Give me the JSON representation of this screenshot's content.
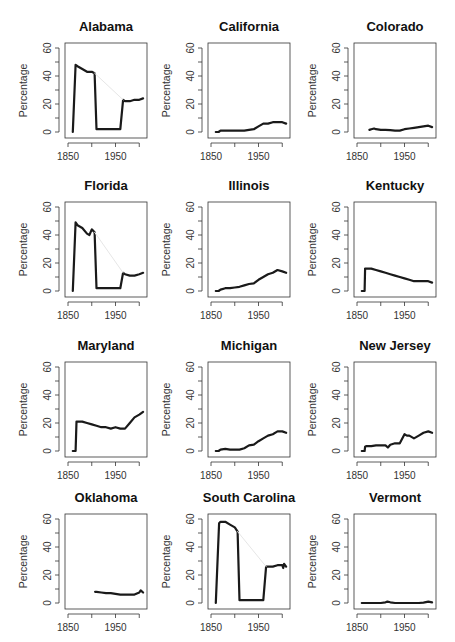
{
  "figure": {
    "ylabel": "Percentage",
    "x_ticks": [
      1850,
      1900,
      1950,
      2000
    ],
    "x_tick_labels": [
      "1850",
      "1950"
    ],
    "y_ticks": [
      0,
      10,
      20,
      30,
      40,
      50,
      60
    ],
    "y_tick_labels": [
      "0",
      "20",
      "40",
      "60"
    ],
    "line_color": "#1a1a1a",
    "gap_color": "#e6e6e6"
  },
  "chart_data": [
    {
      "type": "line",
      "title": "Alabama",
      "xlabel": "",
      "ylabel": "Percentage",
      "xlim": [
        1850,
        2010
      ],
      "ylim": [
        0,
        60
      ],
      "grid": false,
      "series": [
        {
          "name": "main",
          "x": [
            1860,
            1866,
            1870,
            1880,
            1890,
            1900,
            1906,
            1910,
            1920,
            1930,
            1940,
            1950,
            1960,
            1966,
            1970,
            1980,
            1990,
            2000,
            2008
          ],
          "y": [
            0,
            48,
            47,
            45,
            43,
            43,
            42,
            2,
            2,
            2,
            2,
            2,
            2,
            23,
            22,
            22,
            23,
            23,
            24
          ]
        },
        {
          "name": "faint",
          "x": [
            1906,
            1966
          ],
          "y": [
            42,
            23
          ]
        }
      ]
    },
    {
      "type": "line",
      "title": "California",
      "xlabel": "",
      "ylabel": "Percentage",
      "xlim": [
        1850,
        2010
      ],
      "ylim": [
        0,
        60
      ],
      "grid": false,
      "series": [
        {
          "name": "main",
          "x": [
            1860,
            1866,
            1870,
            1880,
            1890,
            1900,
            1910,
            1920,
            1930,
            1940,
            1950,
            1960,
            1970,
            1980,
            1990,
            2000,
            2008
          ],
          "y": [
            0,
            0,
            1,
            1,
            1,
            1,
            1,
            1,
            1.5,
            2,
            4,
            6,
            6,
            7,
            7,
            7,
            6
          ]
        }
      ]
    },
    {
      "type": "line",
      "title": "Colorado",
      "xlabel": "",
      "ylabel": "Percentage",
      "xlim": [
        1850,
        2010
      ],
      "ylim": [
        0,
        60
      ],
      "grid": false,
      "series": [
        {
          "name": "main",
          "x": [
            1876,
            1880,
            1886,
            1890,
            1900,
            1910,
            1920,
            1930,
            1940,
            1950,
            1960,
            1970,
            1980,
            1990,
            2000,
            2008
          ],
          "y": [
            1.5,
            2,
            2.5,
            2,
            1.5,
            1.5,
            1.3,
            1,
            1,
            2,
            2.5,
            3,
            3.5,
            4,
            4.5,
            3.5
          ]
        }
      ]
    },
    {
      "type": "line",
      "title": "Florida",
      "xlabel": "",
      "ylabel": "Percentage",
      "xlim": [
        1850,
        2010
      ],
      "ylim": [
        0,
        60
      ],
      "grid": false,
      "series": [
        {
          "name": "main",
          "x": [
            1860,
            1866,
            1870,
            1880,
            1890,
            1895,
            1900,
            1906,
            1910,
            1920,
            1930,
            1940,
            1950,
            1960,
            1966,
            1970,
            1980,
            1990,
            2000,
            2008
          ],
          "y": [
            0,
            49,
            47,
            45,
            41,
            40,
            44,
            42,
            2,
            2,
            2,
            2,
            2,
            2,
            13,
            12,
            11,
            11,
            12,
            13
          ]
        },
        {
          "name": "faint",
          "x": [
            1906,
            1966
          ],
          "y": [
            42,
            13
          ]
        }
      ]
    },
    {
      "type": "line",
      "title": "Illinois",
      "xlabel": "",
      "ylabel": "Percentage",
      "xlim": [
        1850,
        2010
      ],
      "ylim": [
        0,
        60
      ],
      "grid": false,
      "series": [
        {
          "name": "main",
          "x": [
            1860,
            1866,
            1870,
            1880,
            1890,
            1900,
            1910,
            1920,
            1930,
            1940,
            1950,
            1960,
            1970,
            1980,
            1990,
            2000,
            2008
          ],
          "y": [
            0,
            0,
            1,
            2,
            2,
            2.5,
            3,
            4,
            5,
            5.5,
            8,
            10,
            12,
            13,
            15,
            14,
            13
          ]
        }
      ]
    },
    {
      "type": "line",
      "title": "Kentucky",
      "xlabel": "",
      "ylabel": "Percentage",
      "xlim": [
        1850,
        2010
      ],
      "ylim": [
        0,
        60
      ],
      "grid": false,
      "series": [
        {
          "name": "main",
          "x": [
            1860,
            1866,
            1867,
            1870,
            1880,
            1890,
            1900,
            1910,
            1920,
            1930,
            1940,
            1950,
            1960,
            1970,
            1980,
            1990,
            2000,
            2008
          ],
          "y": [
            0,
            0,
            16,
            16,
            16,
            15,
            14,
            13,
            12,
            11,
            10,
            9,
            8,
            7,
            7,
            7,
            7,
            6
          ]
        }
      ]
    },
    {
      "type": "line",
      "title": "Maryland",
      "xlabel": "",
      "ylabel": "Percentage",
      "xlim": [
        1850,
        2010
      ],
      "ylim": [
        0,
        60
      ],
      "grid": false,
      "series": [
        {
          "name": "main",
          "x": [
            1860,
            1866,
            1868,
            1870,
            1880,
            1890,
            1900,
            1910,
            1920,
            1930,
            1940,
            1950,
            1960,
            1970,
            1980,
            1990,
            2000,
            2008
          ],
          "y": [
            0,
            0,
            21,
            21,
            21,
            20,
            19,
            18,
            17,
            17,
            16,
            17,
            16,
            16,
            20,
            24,
            26,
            28
          ]
        }
      ]
    },
    {
      "type": "line",
      "title": "Michigan",
      "xlabel": "",
      "ylabel": "Percentage",
      "xlim": [
        1850,
        2010
      ],
      "ylim": [
        0,
        60
      ],
      "grid": false,
      "series": [
        {
          "name": "main",
          "x": [
            1860,
            1866,
            1870,
            1880,
            1890,
            1900,
            1910,
            1920,
            1930,
            1940,
            1950,
            1960,
            1970,
            1980,
            1990,
            2000,
            2008
          ],
          "y": [
            0,
            0,
            1,
            1.5,
            1,
            1,
            1,
            2,
            4,
            4.5,
            7,
            9,
            11,
            12,
            14,
            14,
            13
          ]
        }
      ]
    },
    {
      "type": "line",
      "title": "New Jersey",
      "xlabel": "",
      "ylabel": "Percentage",
      "xlim": [
        1850,
        2010
      ],
      "ylim": [
        0,
        60
      ],
      "grid": false,
      "series": [
        {
          "name": "main",
          "x": [
            1860,
            1866,
            1867,
            1870,
            1880,
            1890,
            1900,
            1910,
            1915,
            1920,
            1930,
            1940,
            1950,
            1955,
            1960,
            1970,
            1980,
            1990,
            2000,
            2008
          ],
          "y": [
            0,
            0,
            3,
            3.5,
            3.5,
            4,
            4,
            4,
            2.5,
            4.5,
            5.5,
            5.5,
            12,
            11,
            11,
            9,
            11,
            13,
            14,
            13
          ]
        }
      ]
    },
    {
      "type": "line",
      "title": "Oklahoma",
      "xlabel": "",
      "ylabel": "Percentage",
      "xlim": [
        1850,
        2010
      ],
      "ylim": [
        0,
        60
      ],
      "grid": false,
      "series": [
        {
          "name": "main",
          "x": [
            1907,
            1910,
            1920,
            1930,
            1940,
            1950,
            1960,
            1970,
            1980,
            1990,
            2000,
            2003,
            2008
          ],
          "y": [
            8,
            8,
            7.5,
            7,
            7,
            6.5,
            6,
            6,
            6,
            6,
            7.5,
            9,
            7.5
          ]
        }
      ]
    },
    {
      "type": "line",
      "title": "South Carolina",
      "xlabel": "",
      "ylabel": "Percentage",
      "xlim": [
        1850,
        2010
      ],
      "ylim": [
        0,
        60
      ],
      "grid": false,
      "series": [
        {
          "name": "main",
          "x": [
            1860,
            1867,
            1870,
            1880,
            1890,
            1900,
            1906,
            1910,
            1920,
            1930,
            1940,
            1950,
            1960,
            1966,
            1970,
            1980,
            1990,
            2000,
            2002,
            2004,
            2008
          ],
          "y": [
            0,
            57,
            58,
            58,
            56,
            54,
            51,
            2,
            2,
            2,
            2,
            2,
            2,
            26,
            26,
            26,
            27,
            27,
            25,
            28,
            26
          ]
        },
        {
          "name": "faint",
          "x": [
            1906,
            1966
          ],
          "y": [
            51,
            26
          ]
        }
      ]
    },
    {
      "type": "line",
      "title": "Vermont",
      "xlabel": "",
      "ylabel": "Percentage",
      "xlim": [
        1850,
        2010
      ],
      "ylim": [
        0,
        60
      ],
      "grid": false,
      "series": [
        {
          "name": "main",
          "x": [
            1860,
            1870,
            1880,
            1890,
            1900,
            1910,
            1914,
            1920,
            1930,
            1940,
            1950,
            1960,
            1970,
            1980,
            1990,
            2000,
            2008
          ],
          "y": [
            0,
            0,
            0,
            0,
            0,
            0.5,
            1,
            0.5,
            0,
            0,
            0,
            0,
            0,
            0,
            0.3,
            1,
            0.5
          ]
        }
      ]
    }
  ]
}
